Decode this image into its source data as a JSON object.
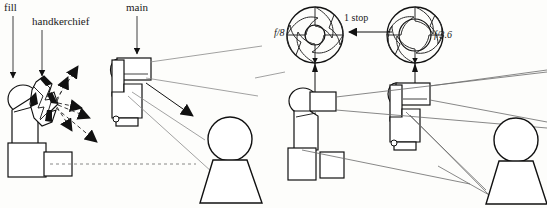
{
  "figure": {
    "background_color": "#fdfdfb",
    "ink_color": "#1a1a1a",
    "width": 547,
    "height": 208
  },
  "left_panel": {
    "labels": {
      "fill": "fill",
      "handkerchief": "handkerchief",
      "main": "main"
    },
    "elements": {
      "fill_flash": "fill-flash-unit",
      "diffuser": "handkerchief-diffuser",
      "main_flash": "main-flash-unit",
      "subject": "subject-figure",
      "scatter_rays": "dashed-scattered-light-rays",
      "main_ray": "solid-direct-light-ray"
    }
  },
  "right_panel": {
    "labels": {
      "aperture_left": "f/8",
      "aperture_right": "f/3.6",
      "stop_difference": "1 stop"
    },
    "elements": {
      "iris_small": "aperture-iris-f8",
      "iris_large": "aperture-iris-f36",
      "flash_left": "left-flash-unit",
      "flash_right": "right-flash-unit",
      "subject": "subject-figure",
      "coverage_lines": "light-coverage-lines",
      "stop_arrow": "one-stop-arrow"
    }
  }
}
